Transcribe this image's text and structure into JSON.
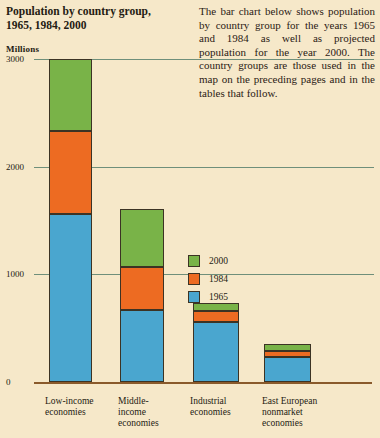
{
  "title": {
    "line1": "Population by country group,",
    "line2": "1965, 1984, 2000"
  },
  "intro": "The bar chart below shows population by country group for the years 1965 and 1984 as well as projected population for the year 2000. The country groups are those used in the map on the preceding pages and in the tables that follow.",
  "colors": {
    "background": "#f6e8c9",
    "year_2000": "#79b348",
    "year_1984": "#ed6b22",
    "year_1965": "#4aa6cf",
    "gridline": "#6f8f7a",
    "axis": "#8a5a2b",
    "outline": "#3c3324",
    "text": "#241b12"
  },
  "legend": {
    "position": "inside-right",
    "entries": [
      {
        "label": "2000",
        "color_key": "year_2000"
      },
      {
        "label": "1984",
        "color_key": "year_1984"
      },
      {
        "label": "1965",
        "color_key": "year_1965"
      }
    ]
  },
  "chart_data": {
    "type": "bar",
    "stacked": true,
    "title": "Population by country group, 1965, 1984, 2000",
    "xlabel": "",
    "ylabel": "Millions",
    "ylim": [
      0,
      3000
    ],
    "yticks": [
      0,
      1000,
      2000,
      3000
    ],
    "ytick_labels": [
      "0",
      "1000",
      "2000",
      "3000"
    ],
    "grid": true,
    "categories": [
      "Low-income economies",
      "Middle-income economies",
      "Industrial economies",
      "East European nonmarket economies"
    ],
    "category_lines": [
      [
        "Low-income",
        "economies"
      ],
      [
        "Middle-",
        "income",
        "economies"
      ],
      [
        "Industrial",
        "economies"
      ],
      [
        "East European",
        "nonmarket",
        "economies"
      ]
    ],
    "series": [
      {
        "name": "1965",
        "color_key": "year_1965",
        "values": [
          1560,
          670,
          560,
          230
        ]
      },
      {
        "name": "1984",
        "color_key": "year_1984",
        "values": [
          770,
          400,
          100,
          55
        ]
      },
      {
        "name": "2000",
        "color_key": "year_2000",
        "values": [
          670,
          540,
          75,
          65
        ]
      }
    ],
    "totals": [
      3000,
      1610,
      735,
      350
    ],
    "units": "Millions"
  }
}
